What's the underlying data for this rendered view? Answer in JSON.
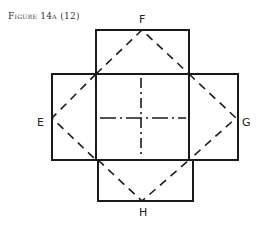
{
  "caption": "Figure 14a (12)",
  "labels": {
    "top": "F",
    "left": "E",
    "right": "G",
    "bottom": "H"
  },
  "colors": {
    "line": "#1a1a1a",
    "background": "#ffffff"
  }
}
